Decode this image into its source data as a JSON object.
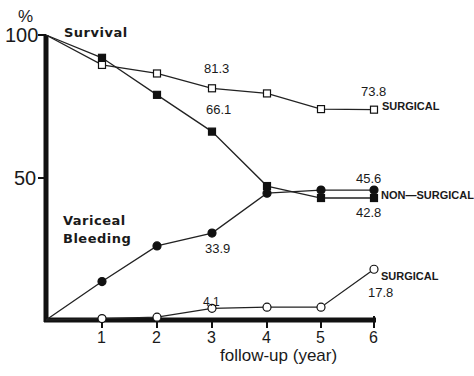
{
  "chart_data": {
    "type": "line",
    "title": "",
    "xlabel": "follow-up (year)",
    "ylabel": "%",
    "xlim": [
      0,
      6
    ],
    "ylim": [
      0,
      100
    ],
    "x_ticks": [
      "1",
      "2",
      "3",
      "4",
      "5",
      "6"
    ],
    "y_ticks": [
      "100",
      "50"
    ],
    "grid": false,
    "x": [
      0,
      1,
      2,
      3,
      4,
      5,
      6
    ],
    "groups": [
      {
        "label": "Survival"
      },
      {
        "label": "Variceal Bleeding",
        "label_line1": "Variceal",
        "label_line2": "Bleeding"
      }
    ],
    "series": [
      {
        "name": "Survival - SURGICAL",
        "group": "Survival",
        "marker": "open-square",
        "values": [
          100,
          89.5,
          86.5,
          81.3,
          79.5,
          74.0,
          73.8
        ]
      },
      {
        "name": "Survival - NON-SURGICAL",
        "group": "Survival",
        "marker": "filled-square",
        "values": [
          100,
          92.0,
          79.0,
          66.1,
          47.0,
          42.8,
          42.8
        ]
      },
      {
        "name": "Variceal Bleeding - NON-SURGICAL",
        "group": "Variceal Bleeding",
        "marker": "filled-circle",
        "values": [
          0,
          13.5,
          26.0,
          30.5,
          44.5,
          45.6,
          45.6
        ]
      },
      {
        "name": "Variceal Bleeding - SURGICAL",
        "group": "Variceal Bleeding",
        "marker": "open-circle",
        "values": [
          0,
          0.5,
          1.0,
          4.1,
          4.5,
          4.5,
          17.8
        ]
      }
    ],
    "annotations": [
      {
        "text": "81.3",
        "series": "Survival - SURGICAL",
        "x": 3
      },
      {
        "text": "73.8",
        "series": "Survival - SURGICAL",
        "x": 6
      },
      {
        "text": "66.1",
        "series": "Survival - NON-SURGICAL",
        "x": 3
      },
      {
        "text": "42.8",
        "series": "Survival - NON-SURGICAL",
        "x": 6
      },
      {
        "text": "45.6",
        "series": "Variceal Bleeding - NON-SURGICAL",
        "x": 6
      },
      {
        "text": "33.9",
        "series": "Variceal Bleeding - NON-SURGICAL",
        "x": 3
      },
      {
        "text": "4.1",
        "series": "Variceal Bleeding - SURGICAL",
        "x": 3
      },
      {
        "text": "17.8",
        "series": "Variceal Bleeding - SURGICAL",
        "x": 6
      }
    ],
    "series_end_labels": {
      "surgical_survival": "SURGICAL",
      "non_surgical": "NON—SURGICAL",
      "surgical_bleeding": "SURGICAL"
    }
  }
}
